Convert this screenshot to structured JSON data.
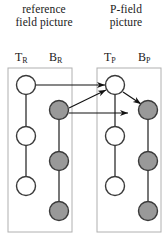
{
  "figure": {
    "width": 167,
    "height": 243,
    "background": "#ffffff"
  },
  "captions": {
    "reference": {
      "line1": "reference",
      "line2": "field picture"
    },
    "pfield": {
      "line1": "P-field",
      "line2": "picture"
    }
  },
  "column_labels": {
    "t_ref": {
      "base": "T",
      "sub": "R"
    },
    "b_ref": {
      "base": "B",
      "sub": "R"
    },
    "t_p": {
      "base": "T",
      "sub": "P"
    },
    "b_p": {
      "base": "B",
      "sub": "P"
    }
  },
  "colors": {
    "top_field_fill": "#ffffff",
    "bottom_field_fill": "#999999",
    "node_stroke": "#3a3a3a",
    "connector": "#555555",
    "box_border": "#b0b0b0",
    "arrow": "#111111",
    "text": "#1a1a1a"
  },
  "boxes": [
    {
      "name": "reference-field-picture-box",
      "x": 8,
      "y": 68,
      "width": 64,
      "height": 164
    },
    {
      "name": "p-field-picture-box",
      "x": 97,
      "y": 68,
      "width": 64,
      "height": 164
    }
  ],
  "nodes": [
    {
      "id": "tr1",
      "column": "T_R",
      "field": "top",
      "cx": 26,
      "cy": 85,
      "r": 9.5
    },
    {
      "id": "tr2",
      "column": "T_R",
      "field": "top",
      "cx": 26,
      "cy": 136,
      "r": 9.5
    },
    {
      "id": "tr3",
      "column": "T_R",
      "field": "top",
      "cx": 26,
      "cy": 186,
      "r": 9.5
    },
    {
      "id": "br1",
      "column": "B_R",
      "field": "bottom",
      "cx": 59,
      "cy": 110,
      "r": 9.5
    },
    {
      "id": "br2",
      "column": "B_R",
      "field": "bottom",
      "cx": 59,
      "cy": 161,
      "r": 9.5
    },
    {
      "id": "br3",
      "column": "B_R",
      "field": "bottom",
      "cx": 59,
      "cy": 211,
      "r": 9.5
    },
    {
      "id": "tp1",
      "column": "T_P",
      "field": "top",
      "cx": 115,
      "cy": 85,
      "r": 9.5
    },
    {
      "id": "tp2",
      "column": "T_P",
      "field": "top",
      "cx": 115,
      "cy": 136,
      "r": 9.5
    },
    {
      "id": "tp3",
      "column": "T_P",
      "field": "top",
      "cx": 115,
      "cy": 186,
      "r": 9.5
    },
    {
      "id": "bp1",
      "column": "B_P",
      "field": "bottom",
      "cx": 148,
      "cy": 110,
      "r": 9.5
    },
    {
      "id": "bp2",
      "column": "B_P",
      "field": "bottom",
      "cx": 148,
      "cy": 161,
      "r": 9.5
    },
    {
      "id": "bp3",
      "column": "B_P",
      "field": "bottom",
      "cx": 148,
      "cy": 211,
      "r": 9.5
    }
  ],
  "connectors": [
    {
      "from": "tr1",
      "to": "tr2"
    },
    {
      "from": "tr2",
      "to": "tr3"
    },
    {
      "from": "br1",
      "to": "br2"
    },
    {
      "from": "br2",
      "to": "br3"
    },
    {
      "from": "tp1",
      "to": "tp2"
    },
    {
      "from": "tp2",
      "to": "tp3"
    },
    {
      "from": "bp1",
      "to": "bp2"
    },
    {
      "from": "bp2",
      "to": "bp3"
    }
  ],
  "arrows": [
    {
      "name": "tr1-to-tp1",
      "from": "tr1",
      "to": "tp1",
      "x1": 36,
      "y1": 85,
      "x2": 105,
      "y2": 85
    },
    {
      "name": "br1-to-tp1",
      "from": "br1",
      "to": "tp1",
      "x1": 69,
      "y1": 108,
      "x2": 106,
      "y2": 90
    },
    {
      "name": "br1-to-bp1",
      "from": "br1",
      "to": "bp1",
      "x1": 69,
      "y1": 113,
      "x2": 128,
      "y2": 113
    },
    {
      "name": "tp1-to-bp1",
      "from": "tp1",
      "to": "bp1",
      "x1": 123,
      "y1": 92,
      "x2": 141,
      "y2": 104
    }
  ]
}
